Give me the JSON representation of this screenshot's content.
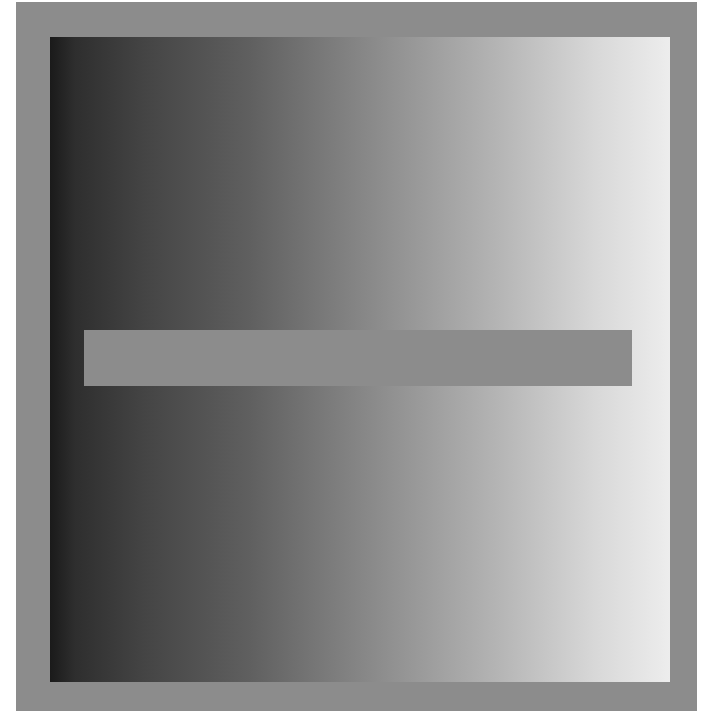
{
  "illusion": {
    "type": "simultaneous-contrast",
    "frame_color": "#8c8c8c",
    "bar_color": "#8c8c8c",
    "gradient": {
      "direction": "left-to-right",
      "start_color": "#1a1a1a",
      "end_color": "#ededed"
    }
  }
}
